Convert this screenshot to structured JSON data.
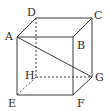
{
  "figure": {
    "type": "cube-diagram",
    "stroke_color": "#3a3a3a",
    "vertices": {
      "A": {
        "label": "A",
        "x": 17,
        "y": 37,
        "lx": 5,
        "ly": 40
      },
      "B": {
        "label": "B",
        "x": 73,
        "y": 37,
        "lx": 77,
        "ly": 49
      },
      "C": {
        "label": "C",
        "x": 92,
        "y": 18,
        "lx": 94,
        "ly": 19
      },
      "D": {
        "label": "D",
        "x": 36,
        "y": 18,
        "lx": 27,
        "ly": 16
      },
      "E": {
        "label": "E",
        "x": 17,
        "y": 95,
        "lx": 8,
        "ly": 107
      },
      "F": {
        "label": "F",
        "x": 73,
        "y": 95,
        "lx": 77,
        "ly": 107
      },
      "G": {
        "label": "G",
        "x": 92,
        "y": 77,
        "lx": 95,
        "ly": 81
      },
      "H": {
        "label": "H",
        "x": 36,
        "y": 77,
        "lx": 25,
        "ly": 79
      }
    },
    "solid_edges": [
      [
        "A",
        "B"
      ],
      [
        "B",
        "F"
      ],
      [
        "F",
        "E"
      ],
      [
        "E",
        "A"
      ],
      [
        "D",
        "C"
      ],
      [
        "A",
        "D"
      ],
      [
        "B",
        "C"
      ],
      [
        "C",
        "G"
      ],
      [
        "F",
        "G"
      ],
      [
        "A",
        "G"
      ]
    ],
    "dashed_edges": [
      [
        "D",
        "H"
      ],
      [
        "H",
        "G"
      ],
      [
        "H",
        "E"
      ]
    ]
  }
}
